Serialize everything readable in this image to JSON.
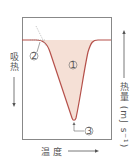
{
  "diagram": {
    "type": "DSC endothermic peak",
    "x_axis_label": "温度",
    "left_axis_label": "吸热",
    "right_axis_label": "热量 (mJ s⁻¹)",
    "markers": [
      {
        "id": "1",
        "label": "①",
        "meaning": "peak area"
      },
      {
        "id": "2",
        "label": "②",
        "meaning": "onset point"
      },
      {
        "id": "3",
        "label": "③",
        "meaning": "peak point"
      }
    ],
    "colors": {
      "curve": "#b5504a",
      "fill": "#f5e0d6",
      "frame": "#888888",
      "text": "#555555"
    }
  }
}
